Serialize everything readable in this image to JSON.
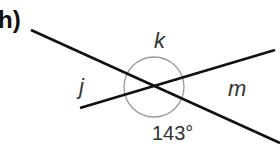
{
  "problem": {
    "part_label": "h)",
    "labels": {
      "top": "k",
      "left": "j",
      "right": "m",
      "bottom": "143°"
    },
    "colors": {
      "line": "#111111",
      "arc": "#999999",
      "text": "#333333"
    }
  }
}
